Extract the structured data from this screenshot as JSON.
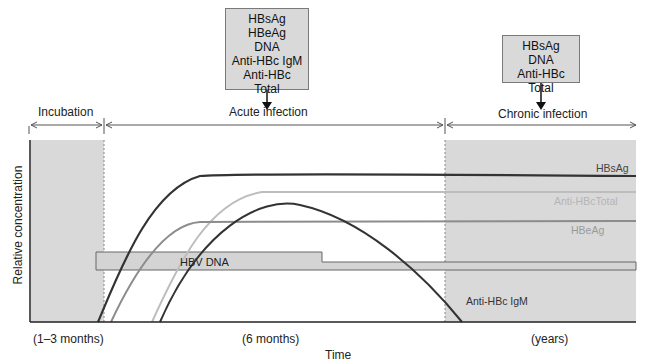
{
  "test_boxes": {
    "acute": {
      "items": [
        "HBsAg",
        "HBeAg",
        "DNA",
        "Anti-HBc IgM",
        "Anti-HBc Total"
      ]
    },
    "chronic": {
      "items": [
        "HBsAg",
        "DNA",
        "Anti-HBc Total"
      ]
    }
  },
  "phases": {
    "incubation": {
      "label": "Incubation",
      "duration": "(1–3 months)"
    },
    "acute": {
      "label": "Acute infection",
      "duration": "(6 months)"
    },
    "chronic": {
      "label": "Chronic infection",
      "duration": "(years)"
    }
  },
  "axes": {
    "x_label": "Time",
    "y_label": "Relative concentration"
  },
  "curves": {
    "hbsag": {
      "label": "HBsAg",
      "color": "#333333"
    },
    "anti_hbc_total": {
      "label": "Anti-HBcTotal",
      "color": "#bdbdbd"
    },
    "hbeag": {
      "label": "HBeAg",
      "color": "#8c8c8c"
    },
    "anti_hbc_igm": {
      "label": "Anti-HBc IgM",
      "color": "#333333"
    },
    "hbv_dna": {
      "label": "HBV DNA",
      "color": "#d4d4d4"
    }
  },
  "colors": {
    "shade": "#d9d9d9",
    "box_fill": "#d9d9d9",
    "axis": "#222222"
  }
}
